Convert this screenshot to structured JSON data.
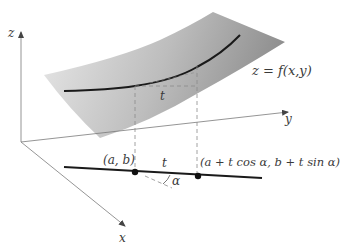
{
  "diagram": {
    "axes": {
      "z_label": "z",
      "y_label": "y",
      "x_label": "x",
      "color": "#7a7a7a"
    },
    "surface": {
      "label": "z = f(x,y)",
      "label_parts": [
        "z",
        " = ",
        "f",
        "(",
        "x",
        ", ",
        "y",
        ")"
      ],
      "gradient_light": "#e6e6e6",
      "gradient_dark": "#9a9a9a"
    },
    "curve_on_surface": {
      "color": "#1a1a1a"
    },
    "segment_label_surface": "t",
    "base_line": {
      "color": "#1a1a1a"
    },
    "points": [
      {
        "id": "p0",
        "label": "(a, b)"
      },
      {
        "id": "p1",
        "label": "(a + t cos α, b + t sin α)"
      }
    ],
    "segment_label_base": "t",
    "angle_label": "α",
    "dashed_color": "#8a8a8a"
  }
}
